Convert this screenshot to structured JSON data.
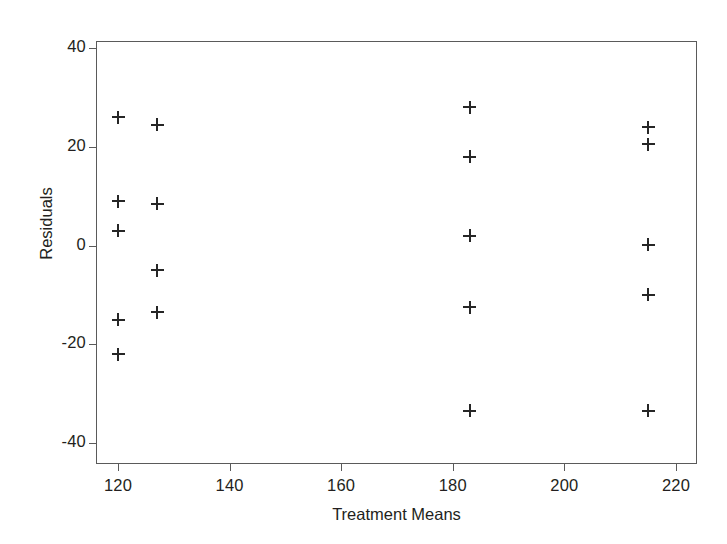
{
  "chart_data": {
    "type": "scatter",
    "title": "",
    "xlabel": "Treatment Means",
    "ylabel": "Residuals",
    "xlim": [
      116,
      224
    ],
    "ylim": [
      -44,
      43
    ],
    "xticks": [
      120,
      140,
      160,
      180,
      200,
      220
    ],
    "xticklabels": [
      "120",
      "140",
      "160",
      "180",
      "200",
      "220"
    ],
    "yticks": [
      40,
      20,
      0,
      -20,
      -40
    ],
    "yticklabels": [
      "40",
      "20",
      "0",
      "-20",
      "-40"
    ],
    "grid": false,
    "legend": null,
    "marker": "plus",
    "marker_color": "#262626",
    "points": [
      {
        "x": 120,
        "y": 26
      },
      {
        "x": 120,
        "y": 9
      },
      {
        "x": 120,
        "y": 3
      },
      {
        "x": 120,
        "y": -15
      },
      {
        "x": 120,
        "y": -22
      },
      {
        "x": 127,
        "y": 24.5
      },
      {
        "x": 127,
        "y": 8.5
      },
      {
        "x": 127,
        "y": -5
      },
      {
        "x": 127,
        "y": -13.5
      },
      {
        "x": 183,
        "y": 28
      },
      {
        "x": 183,
        "y": 18
      },
      {
        "x": 183,
        "y": 2
      },
      {
        "x": 183,
        "y": -12.5
      },
      {
        "x": 183,
        "y": -33.5
      },
      {
        "x": 215,
        "y": 24
      },
      {
        "x": 215,
        "y": 20.5
      },
      {
        "x": 215,
        "y": 0.2
      },
      {
        "x": 215,
        "y": -10
      },
      {
        "x": 215,
        "y": -33.5
      }
    ]
  },
  "figure": {
    "background": "#ffffff",
    "frame_color": "#5a5a5a",
    "text_color": "#231f20"
  }
}
